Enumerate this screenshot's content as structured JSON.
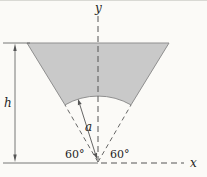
{
  "figure": {
    "labels": {
      "y_axis": "y",
      "x_axis": "x",
      "height": "h",
      "radius": "a",
      "angle_left": "60°",
      "angle_right": "60°"
    },
    "colors": {
      "background": "#fbfaf7",
      "region_fill": "#c9c9c9",
      "region_stroke": "#8f8f8f",
      "line": "#555555",
      "text": "#1f1f1f"
    }
  }
}
